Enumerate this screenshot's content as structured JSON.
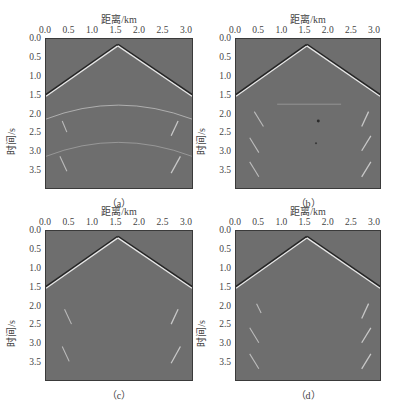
{
  "chart_data": [
    {
      "type": "heatmap",
      "panel": "a",
      "caption": "（a）",
      "xlabel": "距离/km",
      "ylabel": "时间/s",
      "xticks": [
        "0.0",
        "0.5",
        "1.0",
        "1.5",
        "2.0",
        "2.5",
        "3.0"
      ],
      "yticks": [
        "0.0",
        "0.5",
        "1.0",
        "1.5",
        "2.0",
        "2.5",
        "3.0",
        "3.5"
      ],
      "xlim": [
        0,
        3.15
      ],
      "ylim": [
        0,
        4.0
      ],
      "colormap": "gray",
      "events": [
        "direct wave apex at 1.55 km, 0.15 s, reaching 1.5 s at edges",
        "residual reflection arcs near 2.0 s and 3.1 s",
        "diffraction streaks near 2.3 s and 3.3 s at both sides"
      ]
    },
    {
      "type": "heatmap",
      "panel": "b",
      "caption": "（b）",
      "xlabel": "距离/km",
      "ylabel": "时间/s",
      "xticks": [
        "0.0",
        "0.5",
        "1.0",
        "1.5",
        "2.0",
        "2.5",
        "3.0"
      ],
      "yticks": [
        "0.0",
        "0.5",
        "1.0",
        "1.5",
        "2.0",
        "2.5",
        "3.0",
        "3.5"
      ],
      "xlim": [
        0,
        3.15
      ],
      "ylim": [
        0,
        4.0
      ],
      "colormap": "gray",
      "events": [
        "direct wave apex at 1.55 km",
        "faint horizontal event near 1.75 s",
        "streaks near 2.0, 2.7, 3.4 s on both sides",
        "dark spots near 2.2 s and 2.8 s"
      ]
    },
    {
      "type": "heatmap",
      "panel": "c",
      "caption": "（c）",
      "xlabel": "距离/km",
      "ylabel": "时间/s",
      "xticks": [
        "0.0",
        "0.5",
        "1.0",
        "1.5",
        "2.0",
        "2.5",
        "3.0"
      ],
      "yticks": [
        "0.0",
        "0.5",
        "1.0",
        "1.5",
        "2.0",
        "2.5",
        "3.0",
        "3.5"
      ],
      "xlim": [
        0,
        3.15
      ],
      "ylim": [
        0,
        4.0
      ],
      "colormap": "gray",
      "events": [
        "direct wave apex at 1.55 km",
        "streaks near 2.3 s and 3.3 s on both sides"
      ]
    },
    {
      "type": "heatmap",
      "panel": "d",
      "caption": "（d）",
      "xlabel": "距离/km",
      "ylabel": "时间/s",
      "xticks": [
        "0.0",
        "0.5",
        "1.0",
        "1.5",
        "2.0",
        "2.5",
        "3.0"
      ],
      "yticks": [
        "0.0",
        "0.5",
        "1.0",
        "1.5",
        "2.0",
        "2.5",
        "3.0",
        "3.5"
      ],
      "xlim": [
        0,
        3.15
      ],
      "ylim": [
        0,
        4.0
      ],
      "colormap": "gray",
      "events": [
        "direct wave apex at 1.55 km",
        "streaks near 2.0, 2.7, 3.4 s on both sides"
      ]
    }
  ],
  "panels": {
    "a": {
      "xlabel": "距离/km",
      "ylabel": "时间/s",
      "caption": "（a）"
    },
    "b": {
      "xlabel": "距离/km",
      "ylabel": "时间/s",
      "caption": "（b）"
    },
    "c": {
      "xlabel": "距离/km",
      "ylabel": "时间/s",
      "caption": "（c）"
    },
    "d": {
      "xlabel": "距离/km",
      "ylabel": "时间/s",
      "caption": "（d）"
    }
  },
  "xticks": [
    "0.0",
    "0.5",
    "1.0",
    "1.5",
    "2.0",
    "2.5",
    "3.0"
  ],
  "yticks": [
    "0.0",
    "0.5",
    "1.0",
    "1.5",
    "2.0",
    "2.5",
    "3.0",
    "3.5"
  ],
  "colors": {
    "background_gray": "#6e6e6e",
    "event_light": "#d8d8d8",
    "event_dark": "#2a2a2a"
  }
}
